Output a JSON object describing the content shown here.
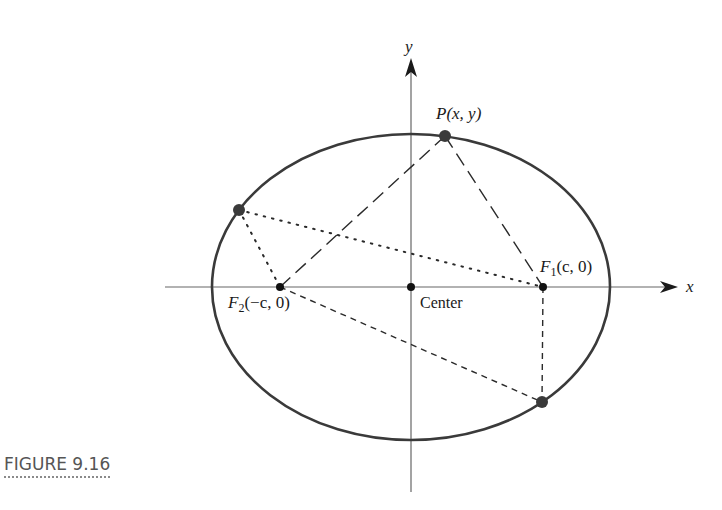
{
  "figure": {
    "caption": "FIGURE 9.16",
    "colors": {
      "ellipse": "#3a3a3a",
      "axis": "#555555",
      "point": "#3a3a3a",
      "text": "#1a1a1a"
    },
    "axes": {
      "x_label": "x",
      "y_label": "y"
    },
    "ellipse": {
      "cx": 411,
      "cy": 287,
      "rx": 199,
      "ry": 153
    },
    "points": {
      "P": {
        "label": "P(x, y)",
        "x": 445,
        "y": 136
      },
      "F1": {
        "label_main": "F",
        "label_sub": "1",
        "label_rest": "(c, 0)",
        "x": 543,
        "y": 287
      },
      "F2": {
        "label_main": "F",
        "label_sub": "2",
        "label_rest": "(−c, 0)",
        "x": 280,
        "y": 287
      },
      "center": {
        "label": "Center",
        "x": 411,
        "y": 287
      },
      "Q_left": {
        "x": 239,
        "y": 210
      },
      "Q_bottom": {
        "x": 542,
        "y": 402
      }
    }
  }
}
